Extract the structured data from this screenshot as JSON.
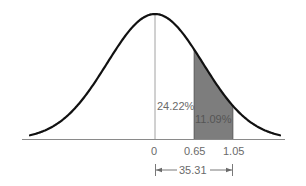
{
  "chart_data": {
    "type": "area",
    "title": "",
    "xlabel": "",
    "ylabel": "",
    "x_ticks": [
      "0",
      "0.65",
      "1.05"
    ],
    "shaded_region": {
      "from": 0.65,
      "to": 1.05,
      "area_label": "11.09%"
    },
    "annotations": [
      {
        "text": "24.22%",
        "meaning": "area between 0 and 0.65"
      },
      {
        "text": "11.09%",
        "meaning": "area between 0.65 and 1.05"
      },
      {
        "text": "35.31",
        "meaning": "area between 0 and 1.05 (percent)"
      }
    ],
    "grid": false,
    "legend": null
  },
  "labels": {
    "area_left": "24.22%",
    "area_shaded": "11.09%",
    "tick_0": "0",
    "tick_065": "0.65",
    "tick_105": "1.05",
    "total_span": "35.31"
  },
  "colors": {
    "curve": "#111111",
    "axis": "#8a8a8a",
    "shade": "#7d7d7d",
    "text": "#6a6a6a"
  }
}
